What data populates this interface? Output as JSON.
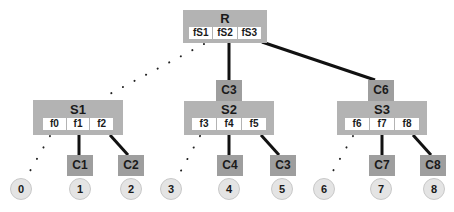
{
  "root": {
    "label": "R",
    "fields": [
      "fS1",
      "fS2",
      "fS3"
    ]
  },
  "subtrees": [
    {
      "label": "S1",
      "connector": null,
      "fields": [
        "f0",
        "f1",
        "f2"
      ],
      "children": [
        "C1",
        "C2"
      ],
      "leaves": [
        "0",
        "1",
        "2"
      ]
    },
    {
      "label": "S2",
      "connector": "C3",
      "fields": [
        "f3",
        "f4",
        "f5"
      ],
      "children": [
        "C4",
        "C3"
      ],
      "leaves": [
        "3",
        "4",
        "5"
      ]
    },
    {
      "label": "S3",
      "connector": "C6",
      "fields": [
        "f6",
        "f7",
        "f8"
      ],
      "children": [
        "C7",
        "C8"
      ],
      "leaves": [
        "6",
        "7",
        "8"
      ]
    }
  ],
  "colors": {
    "node_fill": "#b3b3b3",
    "connector_fill": "#9e9e9e",
    "leaf_fill": "#e4e4e4",
    "edge": "#111111"
  }
}
